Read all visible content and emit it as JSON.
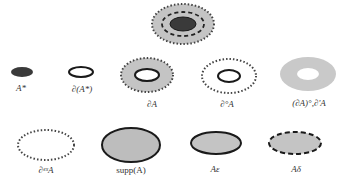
{
  "colors": {
    "dark_fill": "#3a3a3a",
    "gray_fill": "#bdbdbd",
    "light_gray": "#cfcfcf",
    "stroke": "#1a1a1a",
    "dotted": "#444444"
  },
  "figures": [
    {
      "id": "top",
      "label": ""
    },
    {
      "id": "a-star",
      "label": "A*"
    },
    {
      "id": "boundary-a-star",
      "label": "∂(A*)"
    },
    {
      "id": "boundary-a",
      "label": "∂A"
    },
    {
      "id": "boundary-o-a",
      "label": "∂°A"
    },
    {
      "id": "boundary-interior",
      "label": "(∂A)°,∂'A"
    },
    {
      "id": "boundary-ex-a",
      "label": "∂ᵉˣA"
    },
    {
      "id": "supp-a",
      "label": "supp(A)"
    },
    {
      "id": "a-epsilon",
      "label": "Aε"
    },
    {
      "id": "a-delta",
      "label": "Aδ"
    }
  ]
}
